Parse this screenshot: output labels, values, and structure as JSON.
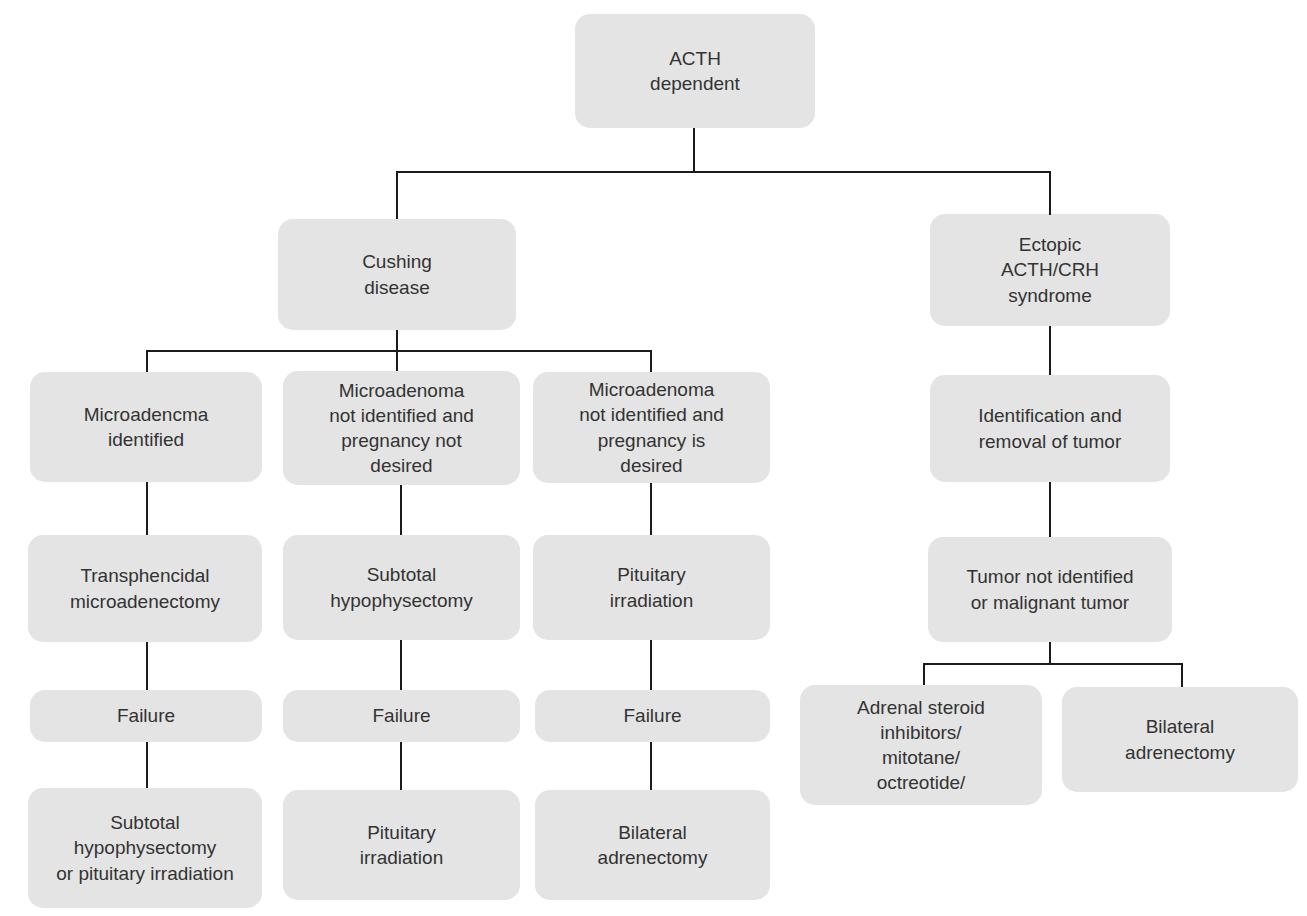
{
  "diagram": {
    "type": "flowchart",
    "colors": {
      "box_fill": "#e4e4e4",
      "connector": "#1b1b1b",
      "text": "#333333",
      "background": "#ffffff"
    },
    "nodes": {
      "acth_dependent": "ACTH\ndependent",
      "cushing_disease": "Cushing\ndisease",
      "ectopic_acth_crh_syndrome": "Ectopic\nACTH/CRH\nsyndrome",
      "microadenoma_identified": "Microadencma\nidentified",
      "microadenoma_not_identified_pregnancy_not_desired": "Microadenoma\nnot identified and\npregnancy not\ndesired",
      "microadenoma_not_identified_pregnancy_is_desired": "Microadenoma\nnot identified and\npregnancy is\ndesired",
      "identification_and_removal_of_tumor": "Identification and\nremoval of tumor",
      "transsphenoidal_microadenectomy": "Transphencidal\nmicroadenectomy",
      "subtotal_hypophysectomy": "Subtotal\nhypophysectomy",
      "pituitary_irradiation_step": "Pituitary\nirradiation",
      "tumor_not_identified_or_malignant": "Tumor not identified\nor malignant tumor",
      "failure_1": "Failure",
      "failure_2": "Failure",
      "failure_3": "Failure",
      "subtotal_hypophysectomy_or_pituitary_irradiation": "Subtotal\nhypophysectomy\nor pituitary irradiation",
      "pituitary_irradiation_final": "Pituitary\nirradiation",
      "bilateral_adrenectomy_final": "Bilateral\nadrenectomy",
      "adrenal_steroid_inhibitors": "Adrenal steroid\ninhibitors/\nmitotane/\noctreotide/",
      "bilateral_adrenectomy_right": "Bilateral\nadrenectomy"
    },
    "edges": [
      [
        "acth_dependent",
        "cushing_disease"
      ],
      [
        "acth_dependent",
        "ectopic_acth_crh_syndrome"
      ],
      [
        "cushing_disease",
        "microadenoma_identified"
      ],
      [
        "cushing_disease",
        "microadenoma_not_identified_pregnancy_not_desired"
      ],
      [
        "cushing_disease",
        "microadenoma_not_identified_pregnancy_is_desired"
      ],
      [
        "microadenoma_identified",
        "transsphenoidal_microadenectomy"
      ],
      [
        "transsphenoidal_microadenectomy",
        "failure_1"
      ],
      [
        "failure_1",
        "subtotal_hypophysectomy_or_pituitary_irradiation"
      ],
      [
        "microadenoma_not_identified_pregnancy_not_desired",
        "subtotal_hypophysectomy"
      ],
      [
        "subtotal_hypophysectomy",
        "failure_2"
      ],
      [
        "failure_2",
        "pituitary_irradiation_final"
      ],
      [
        "microadenoma_not_identified_pregnancy_is_desired",
        "pituitary_irradiation_step"
      ],
      [
        "pituitary_irradiation_step",
        "failure_3"
      ],
      [
        "failure_3",
        "bilateral_adrenectomy_final"
      ],
      [
        "ectopic_acth_crh_syndrome",
        "identification_and_removal_of_tumor"
      ],
      [
        "identification_and_removal_of_tumor",
        "tumor_not_identified_or_malignant"
      ],
      [
        "tumor_not_identified_or_malignant",
        "adrenal_steroid_inhibitors"
      ],
      [
        "tumor_not_identified_or_malignant",
        "bilateral_adrenectomy_right"
      ]
    ]
  }
}
